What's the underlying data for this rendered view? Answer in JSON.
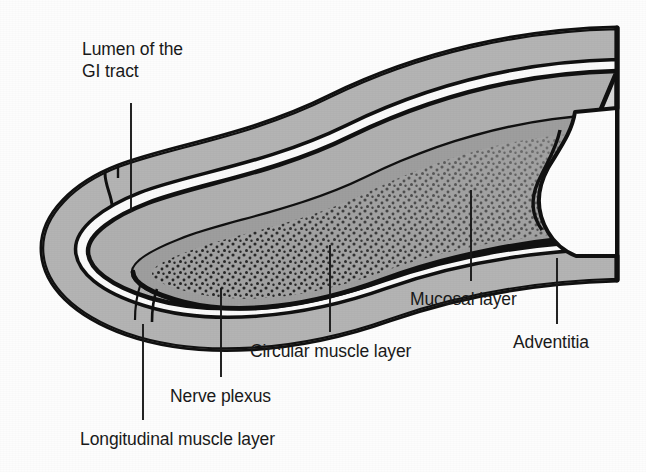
{
  "figure": {
    "background_color": "#fdfdfd",
    "outline_color": "#111111"
  },
  "labels": [
    {
      "id": "lumen",
      "text": "Lumen of the GI tract",
      "line1": "Lumen of the",
      "line2": "GI tract",
      "x": 82,
      "y": 38,
      "leader": {
        "x1": 131,
        "y1": 103,
        "x2": 131,
        "y2": 212
      }
    },
    {
      "id": "longitudinal-muscle",
      "text": "Longitudinal muscle layer",
      "x": 80,
      "y": 429,
      "leader": {
        "x1": 143,
        "y1": 324,
        "x2": 143,
        "y2": 420
      }
    },
    {
      "id": "nerve-plexus",
      "text": "Nerve plexus",
      "x": 170,
      "y": 386,
      "leader": {
        "x1": 221,
        "y1": 288,
        "x2": 221,
        "y2": 377
      }
    },
    {
      "id": "circular-muscle",
      "text": "Circular muscle layer",
      "x": 250,
      "y": 341,
      "leader": {
        "x1": 330,
        "y1": 245,
        "x2": 330,
        "y2": 332
      }
    },
    {
      "id": "mucosal-layer",
      "text": "Mucosal layer",
      "x": 410,
      "y": 289,
      "leader": {
        "x1": 471,
        "y1": 190,
        "x2": 471,
        "y2": 281
      }
    },
    {
      "id": "adventitia",
      "text": "Adventitia",
      "x": 513,
      "y": 332,
      "leader": {
        "x1": 557,
        "y1": 258,
        "x2": 557,
        "y2": 324
      }
    }
  ],
  "layers": [
    {
      "id": "adventitia",
      "name": "Adventitia",
      "fill": "#d8d8d8"
    },
    {
      "id": "longitudinal-muscle",
      "name": "Longitudinal muscle layer",
      "fill": "#b3b3b3"
    },
    {
      "id": "nerve-plexus",
      "name": "Nerve plexus",
      "fill": "#ffffff"
    },
    {
      "id": "circular-muscle",
      "name": "Circular muscle layer",
      "fill": "#b0b0b0"
    },
    {
      "id": "submucosa",
      "name": "Submucosa",
      "fill": "#a6a6a6"
    },
    {
      "id": "mucosal-layer",
      "name": "Mucosal layer",
      "fill": "#a0a0a0",
      "texture": "stipple"
    },
    {
      "id": "lumen",
      "name": "Lumen of the GI tract",
      "fill": "#9d9d9d"
    }
  ]
}
